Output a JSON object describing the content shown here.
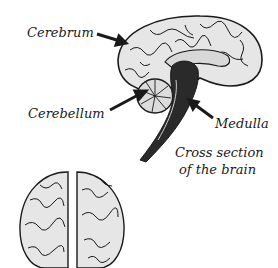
{
  "diagram": {
    "labels": {
      "cerebrum": "Cerebrum",
      "cerebellum": "Cerebellum",
      "medulla": "Medulla",
      "caption_line1": "Cross section",
      "caption_line2": "of the brain"
    },
    "colors": {
      "ink": "#1a1a1a",
      "brain_fill": "#e8e8e8",
      "dark_fill": "#2a2a2a",
      "background": "#ffffff"
    }
  }
}
